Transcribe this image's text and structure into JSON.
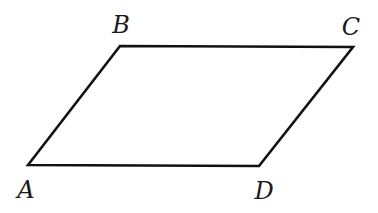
{
  "diagram": {
    "type": "parallelogram",
    "stroke_color": "#111111",
    "vertices": [
      {
        "name": "A",
        "x": 28,
        "y": 165,
        "label_x": 26,
        "label_y": 198
      },
      {
        "name": "B",
        "x": 120,
        "y": 46,
        "label_x": 121,
        "label_y": 33
      },
      {
        "name": "C",
        "x": 353,
        "y": 47,
        "label_x": 351,
        "label_y": 35
      },
      {
        "name": "D",
        "x": 259,
        "y": 166,
        "label_x": 264,
        "label_y": 199
      }
    ],
    "edges": [
      {
        "from": "A",
        "to": "B"
      },
      {
        "from": "B",
        "to": "C"
      },
      {
        "from": "C",
        "to": "D"
      },
      {
        "from": "D",
        "to": "A"
      }
    ]
  }
}
